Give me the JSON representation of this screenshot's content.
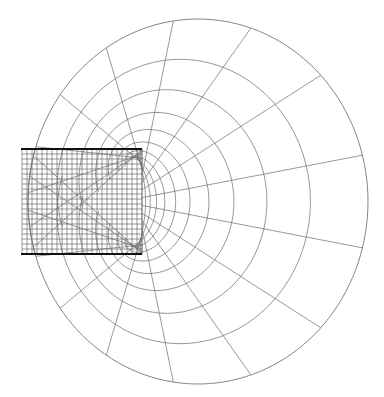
{
  "diagram": {
    "type": "finite-element-mesh",
    "colors": {
      "background": "#ffffff",
      "mesh_line": "#6a6a6a",
      "fine_mesh_line": "#555555",
      "crack_line": "#111111"
    },
    "crack_faces": [
      {
        "name": "top-crack",
        "x1": 21,
        "x2": 142,
        "y": 149
      },
      {
        "name": "bottom-crack",
        "x1": 21,
        "x2": 142,
        "y": 254
      }
    ],
    "crack_tips": [
      {
        "x": 142,
        "y": 149
      },
      {
        "x": 142,
        "y": 254
      }
    ],
    "fine_grid": {
      "x_start": 22,
      "x_end": 142,
      "y_start": 149,
      "y_end": 254,
      "columns": 24,
      "rows": 21
    },
    "outer_boundary": {
      "shape": "ellipse-arc",
      "cx": 198,
      "cy": 201.5,
      "rx": 170,
      "ry": 182.5
    },
    "radial_region": {
      "ring_count": 11,
      "ring_growth": 1.32,
      "spoke_count": 21
    }
  }
}
